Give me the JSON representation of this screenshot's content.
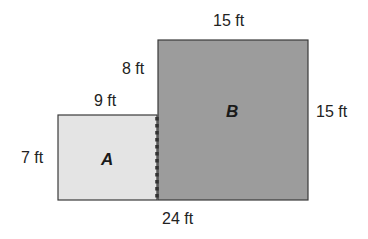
{
  "diagram": {
    "type": "composite-area-figure",
    "units": "ft",
    "regions": [
      {
        "id": "A",
        "label": "A",
        "width": 9,
        "height": 7,
        "fill": "#e4e4e4"
      },
      {
        "id": "B",
        "label": "B",
        "width": 15,
        "height": 15,
        "fill": "#9c9c9c"
      }
    ],
    "dimension_labels": {
      "b_top": "15 ft",
      "b_left_upper": "8 ft",
      "a_top": "9 ft",
      "b_right": "15 ft",
      "a_left": "7 ft",
      "bottom_total": "24 ft"
    },
    "colors": {
      "outline": "#3a3a3a",
      "divider_dots": "#333333"
    }
  }
}
